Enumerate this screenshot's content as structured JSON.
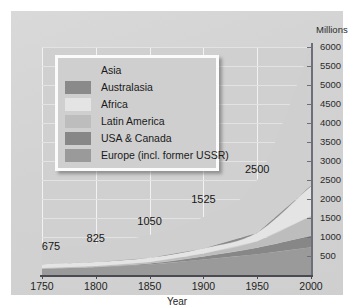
{
  "chart_data": {
    "type": "area",
    "title": "",
    "subtitle": "",
    "xlabel": "Year",
    "ylabel": "Millions",
    "ylabel_position": "top-right",
    "xlim": [
      1750,
      2000
    ],
    "ylim": [
      0,
      6000
    ],
    "grid": true,
    "stacked": true,
    "legend_position": "upper-left",
    "x": [
      1750,
      1800,
      1850,
      1900,
      1950,
      2000
    ],
    "xticks": [
      "1750",
      "1800",
      "1850",
      "1900",
      "1950",
      "2000"
    ],
    "yticks": [
      "500",
      "1000",
      "1500",
      "2000",
      "2500",
      "3000",
      "3500",
      "4000",
      "4500",
      "5000",
      "5500",
      "6000"
    ],
    "ytick_values": [
      500,
      1000,
      1500,
      2000,
      2500,
      3000,
      3500,
      4000,
      4500,
      5000,
      5500,
      6000
    ],
    "series": [
      {
        "name": "Europe (incl. former USSR)",
        "color": "#9a9a9a",
        "values": [
          163,
          203,
          276,
          408,
          547,
          729
        ]
      },
      {
        "name": "USA & Canada",
        "color": "#878787",
        "values": [
          2,
          7,
          26,
          82,
          172,
          307
        ]
      },
      {
        "name": "Latin America",
        "color": "#bdbdbd",
        "values": [
          16,
          24,
          38,
          74,
          167,
          515
        ]
      },
      {
        "name": "Africa",
        "color": "#e4e4e4",
        "values": [
          104,
          107,
          111,
          133,
          221,
          784
        ]
      },
      {
        "name": "Australasia",
        "color": "#8a8a8a",
        "values": [
          2,
          2,
          2,
          6,
          13,
          30
        ]
      },
      {
        "name": "Asia",
        "color": "#cfcfcf",
        "values": [
          388,
          482,
          597,
          822,
          1380,
          3635
        ]
      }
    ],
    "totals": [
      675,
      825,
      1050,
      1525,
      2500,
      6000
    ],
    "annotations": [
      {
        "text": "675",
        "x": 1750
      },
      {
        "text": "825",
        "x": 1800
      },
      {
        "text": "1050",
        "x": 1850
      },
      {
        "text": "1525",
        "x": 1900
      },
      {
        "text": "2500",
        "x": 1950
      }
    ]
  },
  "axis": {
    "y_unit_label": "Millions",
    "x_axis_label": "Year"
  },
  "legend": {
    "items": [
      {
        "label": "Asia"
      },
      {
        "label": "Australasia"
      },
      {
        "label": "Africa"
      },
      {
        "label": "Latin America"
      },
      {
        "label": "USA & Canada"
      },
      {
        "label": "Europe (incl. former USSR)"
      }
    ]
  },
  "colors": {
    "plate": "#d4d4d4",
    "plot_background": "#d0d0d0",
    "gridline": "#f2f2f2",
    "axis": "#4a4a52",
    "text": "#1a1a1a",
    "legend_border": "#fbfbfb"
  }
}
